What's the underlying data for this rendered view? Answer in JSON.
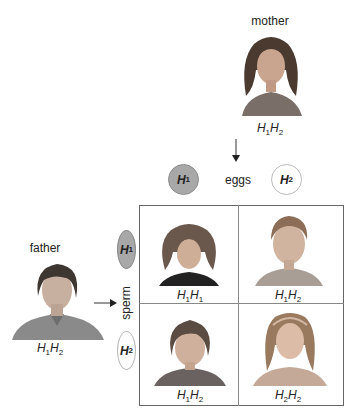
{
  "mother": {
    "label": "mother",
    "genotype": {
      "a": "H",
      "a_sub": "1",
      "b": "H",
      "b_sub": "2"
    }
  },
  "father": {
    "label": "father",
    "genotype": {
      "a": "H",
      "a_sub": "1",
      "b": "H",
      "b_sub": "2"
    }
  },
  "eggs": {
    "label": "eggs",
    "items": [
      {
        "allele": "H",
        "sub": "1",
        "style": "filled"
      },
      {
        "allele": "H",
        "sub": "2",
        "style": "empty"
      }
    ]
  },
  "sperm": {
    "label": "sperm",
    "items": [
      {
        "allele": "H",
        "sub": "1",
        "style": "filled"
      },
      {
        "allele": "H",
        "sub": "2",
        "style": "empty"
      }
    ]
  },
  "offspring": [
    {
      "position": "top-left",
      "genotype": {
        "a": "H",
        "a_sub": "1",
        "b": "H",
        "b_sub": "1"
      },
      "portrait": "curly-haired girl"
    },
    {
      "position": "top-right",
      "genotype": {
        "a": "H",
        "a_sub": "1",
        "b": "H",
        "b_sub": "2"
      },
      "portrait": "young boy"
    },
    {
      "position": "bottom-left",
      "genotype": {
        "a": "H",
        "a_sub": "1",
        "b": "H",
        "b_sub": "2"
      },
      "portrait": "wavy-haired boy"
    },
    {
      "position": "bottom-right",
      "genotype": {
        "a": "H",
        "a_sub": "2",
        "b": "H",
        "b_sub": "2"
      },
      "portrait": "girl with headband"
    }
  ],
  "colors": {
    "filled_gamete": "#a8a8a8",
    "grid_border": "#666666",
    "text": "#222222"
  }
}
